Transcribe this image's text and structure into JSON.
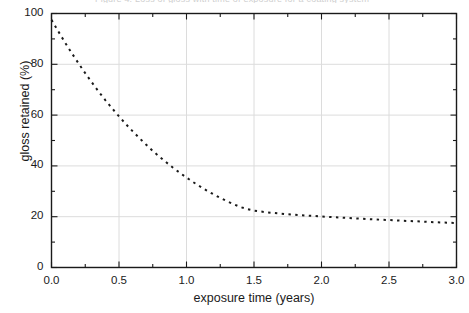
{
  "figure": {
    "top_caption": "Figure 4.   Loss of gloss with time of exposure for a coating system",
    "background": "#ffffff",
    "frame_color": "#1a1a1a",
    "grid_color": "#dcdcdc",
    "curve_color": "#1a1a1a"
  },
  "chart_data": {
    "type": "line",
    "title": "",
    "subtitle": "",
    "xlabel": "exposure time (years)",
    "ylabel": "gloss retained (%)",
    "xlim": [
      0.0,
      3.0
    ],
    "ylim": [
      0,
      100
    ],
    "xticks": [
      0.0,
      0.5,
      1.0,
      1.5,
      2.0,
      2.5,
      3.0
    ],
    "xticklabels": [
      "0.0",
      "0.5",
      "1.0",
      "1.5",
      "2.0",
      "2.5",
      "3.0"
    ],
    "yticks": [
      0,
      20,
      40,
      60,
      80,
      100
    ],
    "yticklabels": [
      "0",
      "20",
      "40",
      "60",
      "80",
      "100"
    ],
    "xminor_ticks": [
      0.25,
      0.75,
      1.25,
      1.75,
      2.25,
      2.75
    ],
    "yminor_ticks": [
      10,
      30,
      50,
      70,
      90
    ],
    "grid": true,
    "grid_axes": "both",
    "legend": null,
    "linestyle": "dotted",
    "linewidth": 2.0,
    "series": [
      {
        "name": "gloss retained",
        "x": [
          0.0,
          0.05,
          0.1,
          0.15,
          0.2,
          0.25,
          0.3,
          0.35,
          0.4,
          0.45,
          0.5,
          0.55,
          0.6,
          0.65,
          0.7,
          0.75,
          0.8,
          0.85,
          0.9,
          0.95,
          1.0,
          1.05,
          1.1,
          1.15,
          1.2,
          1.25,
          1.3,
          1.35,
          1.4,
          1.45,
          1.5,
          1.6,
          1.7,
          1.8,
          1.9,
          2.0,
          2.1,
          2.2,
          2.3,
          2.4,
          2.5,
          2.6,
          2.7,
          2.8,
          2.9,
          3.0
        ],
        "y": [
          97.5,
          93.0,
          88.6,
          84.4,
          80.4,
          76.5,
          72.8,
          69.2,
          65.8,
          62.6,
          59.5,
          56.5,
          53.7,
          51.0,
          48.4,
          45.9,
          43.6,
          41.4,
          39.3,
          37.3,
          35.4,
          33.6,
          31.9,
          30.3,
          28.8,
          27.4,
          26.1,
          24.9,
          23.8,
          23.0,
          22.4,
          21.7,
          21.2,
          20.8,
          20.4,
          20.1,
          19.8,
          19.5,
          19.2,
          18.9,
          18.7,
          18.4,
          18.2,
          17.9,
          17.7,
          17.5
        ]
      }
    ]
  }
}
